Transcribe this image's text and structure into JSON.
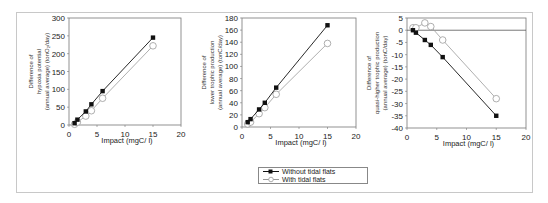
{
  "chart_data": [
    {
      "type": "line",
      "title": "",
      "xlabel": "Impact (mgC/ l)",
      "ylabel": "Difference of hypoxia potential (annual average) (tonO2/day)",
      "ylabel_lines": [
        "Difference of",
        "hypoxia potential",
        "(annual average)  (tonO₂/day)"
      ],
      "xlim": [
        0,
        20
      ],
      "ylim": [
        0,
        300
      ],
      "xticks": [
        0,
        5,
        10,
        15,
        20
      ],
      "yticks": [
        0,
        50,
        100,
        150,
        200,
        250,
        300
      ],
      "grid": false,
      "x": [
        1,
        1.5,
        3,
        4,
        6,
        15
      ],
      "series": [
        {
          "name": "Without tidal flats",
          "values": [
            5,
            15,
            38,
            58,
            95,
            245
          ]
        },
        {
          "name": "With tidal flats",
          "values": [
            2,
            8,
            25,
            40,
            75,
            222
          ]
        }
      ]
    },
    {
      "type": "line",
      "title": "",
      "xlabel": "Impact (mgC/ l)",
      "ylabel": "Difference of lower trophic production (annual average) (tonC/day)",
      "ylabel_lines": [
        "Difference of",
        "lower trophic production",
        "(annual average)  (tonC/day)"
      ],
      "xlim": [
        0,
        20
      ],
      "ylim": [
        0,
        180
      ],
      "xticks": [
        0,
        5,
        10,
        15,
        20
      ],
      "yticks": [
        0,
        20,
        40,
        60,
        80,
        100,
        120,
        140,
        160,
        180
      ],
      "grid": false,
      "x": [
        1,
        1.5,
        3,
        4,
        6,
        15
      ],
      "series": [
        {
          "name": "Without tidal flats",
          "values": [
            8,
            13,
            29,
            40,
            65,
            168
          ]
        },
        {
          "name": "With tidal flats",
          "values": [
            5,
            8,
            22,
            32,
            54,
            138
          ]
        }
      ]
    },
    {
      "type": "line",
      "title": "",
      "xlabel": "Impact (mgC/ l)",
      "ylabel": "Difference of quasi-higher trophic production (annual average) (tonC/day)",
      "ylabel_lines": [
        "Difference of",
        "quasi-higher trophic production",
        "(annual average)  (tonC/day)"
      ],
      "xlim": [
        0,
        20
      ],
      "ylim": [
        -40,
        5
      ],
      "xticks": [
        0,
        5,
        10,
        15,
        20
      ],
      "yticks": [
        5,
        0,
        -5,
        -10,
        -15,
        -20,
        -25,
        -30,
        -35,
        -40
      ],
      "grid": false,
      "zero_line": true,
      "x": [
        1,
        1.5,
        3,
        4,
        6,
        15
      ],
      "series": [
        {
          "name": "Without tidal flats",
          "values": [
            0,
            -1,
            -4,
            -6,
            -11,
            -35
          ]
        },
        {
          "name": "With tidal flats",
          "values": [
            1,
            1,
            3,
            1.5,
            -4,
            -28
          ]
        }
      ]
    }
  ],
  "legend": {
    "position": "bottom-center",
    "items": [
      {
        "label": "Without tidal flats",
        "marker": "filled-square",
        "color": "#000000"
      },
      {
        "label": "With tidal flats",
        "marker": "open-circle",
        "color": "#999999"
      }
    ]
  },
  "colors": {
    "without": "#111111",
    "with": "#9a9a9a",
    "axis": "#555555",
    "frame": "#c8c8c8"
  }
}
